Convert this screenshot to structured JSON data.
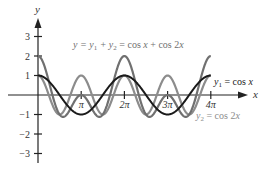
{
  "chart_data": {
    "type": "line",
    "title": "",
    "xlabel": "x",
    "ylabel": "y",
    "xlim": [
      0,
      12.566
    ],
    "ylim": [
      -3,
      3
    ],
    "x_ticks": [
      {
        "value": 3.14159,
        "label": "π"
      },
      {
        "value": 6.28319,
        "label": "2π"
      },
      {
        "value": 9.42478,
        "label": "3π"
      },
      {
        "value": 12.56637,
        "label": "4π"
      }
    ],
    "y_ticks": [
      {
        "value": 3,
        "label": "3"
      },
      {
        "value": 2,
        "label": "2"
      },
      {
        "value": 1,
        "label": "1"
      },
      {
        "value": -1,
        "label": "−1"
      },
      {
        "value": -2,
        "label": "−2"
      },
      {
        "value": -3,
        "label": "−3"
      }
    ],
    "grid": false,
    "series": [
      {
        "name": "y2 = cos 2x",
        "expr": "cos2x",
        "color": "#8c8c8c",
        "x": [
          0,
          1.5708,
          3.1416,
          4.7124,
          6.2832,
          7.854,
          9.4248,
          10.9956,
          12.5664
        ],
        "values": [
          1,
          -1,
          1,
          -1,
          1,
          -1,
          1,
          -1,
          1
        ]
      },
      {
        "name": "y = y1 + y2 = cos x + cos 2x",
        "expr": "sum",
        "color": "#707070",
        "x": [
          0,
          1.8235,
          3.1416,
          4.4597,
          6.2832,
          8.1067,
          9.4248,
          10.7429,
          12.5664
        ],
        "values": [
          2,
          -1.125,
          0,
          -1.125,
          2,
          -1.125,
          0,
          -1.125,
          2
        ]
      },
      {
        "name": "y1 = cos x",
        "expr": "cosx",
        "color": "#1a1a1a",
        "x": [
          0,
          3.1416,
          6.2832,
          9.4248,
          12.5664
        ],
        "values": [
          1,
          -1,
          1,
          -1,
          1
        ]
      }
    ],
    "annotations": [
      {
        "text": "y = y₁ + y₂ = cos x + cos 2x",
        "color": "#707070"
      },
      {
        "text": "y₁ = cos x",
        "color": "#1a1a1a"
      },
      {
        "text": "y₂ = cos 2x",
        "color": "#8c8c8c"
      }
    ]
  },
  "labels": {
    "x_axis": "x",
    "y_axis": "y",
    "sum_prefix": "y = y",
    "sum_mid": " + y",
    "sum_suffix": " = cos ",
    "sum_x": "x",
    "sum_tail": " + cos 2",
    "sum_x2": "x",
    "y1_prefix": "y",
    "y1_suffix": " = cos ",
    "y1_x": "x",
    "y2_prefix": "y",
    "y2_suffix": " = cos 2",
    "y2_x": "x",
    "sub1": "1",
    "sub2": "2"
  }
}
